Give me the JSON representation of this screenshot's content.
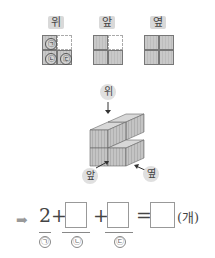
{
  "views": {
    "top": {
      "label": "위",
      "markers": [
        "㉠",
        "㉡",
        "㉢"
      ]
    },
    "front": {
      "label": "앞"
    },
    "side": {
      "label": "옆"
    }
  },
  "figure": {
    "top_label": "위",
    "front_label": "앞",
    "side_label": "옆"
  },
  "equation": {
    "arrow": "➡",
    "first_value": "2",
    "plus1": "+",
    "plus2": "+",
    "equals": "=",
    "unit": "(개)",
    "sub_a": "㉠",
    "sub_b": "㉡",
    "sub_c": "㉢",
    "box_b": "",
    "box_c": "",
    "box_total": ""
  }
}
